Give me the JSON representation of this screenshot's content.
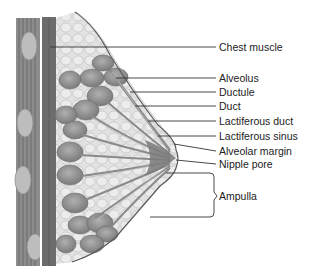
{
  "diagram": {
    "colors": {
      "muscle_dark": "#6e6e6e",
      "muscle_light": "#9a9a9a",
      "fat": "#e4e4e4",
      "fat_outline": "#bdbdbd",
      "lobule": "#8a8a8a",
      "lobule_highlight": "#a8a8a8",
      "skin_line": "#555555",
      "leader_line": "#333333",
      "text": "#222222"
    },
    "labels": [
      {
        "id": "chest-muscle",
        "text": "Chest muscle",
        "y": 47
      },
      {
        "id": "alveolus",
        "text": "Alveolus",
        "y": 78
      },
      {
        "id": "ductule",
        "text": "Ductule",
        "y": 92
      },
      {
        "id": "duct",
        "text": "Duct",
        "y": 106
      },
      {
        "id": "lactiferous-duct",
        "text": "Lactiferous duct",
        "y": 121
      },
      {
        "id": "lactiferous-sinus",
        "text": "Lactiferous sinus",
        "y": 136
      },
      {
        "id": "alveolar-margin",
        "text": "Alveolar margin",
        "y": 151
      },
      {
        "id": "nipple-pore",
        "text": "Nipple pore",
        "y": 164
      },
      {
        "id": "ampulla",
        "text": "Ampulla",
        "y": 196
      }
    ]
  }
}
